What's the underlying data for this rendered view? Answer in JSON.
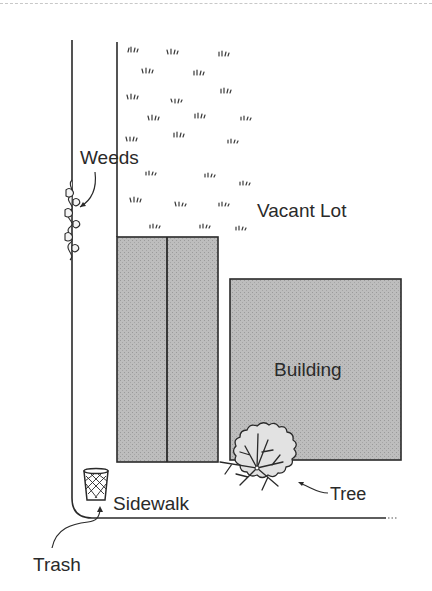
{
  "diagram": {
    "type": "site-plan-sketch",
    "labels": {
      "weeds": "Weeds",
      "vacant_lot": "Vacant Lot",
      "building": "Building",
      "tree": "Tree",
      "sidewalk": "Sidewalk",
      "trash": "Trash"
    },
    "colors": {
      "line": "#2a2a2a",
      "building_fill": "#b8b8b8",
      "tree_fill": "#e2e2e2",
      "background": "#ffffff"
    },
    "elements": [
      {
        "name": "Vacant Lot",
        "kind": "grass-area"
      },
      {
        "name": "Building",
        "kind": "large-block"
      },
      {
        "name": "Adjacent building",
        "kind": "two-part-block"
      },
      {
        "name": "Tree",
        "kind": "canopy"
      },
      {
        "name": "Weeds",
        "kind": "sidewalk-weeds"
      },
      {
        "name": "Trash",
        "kind": "waste-basket"
      },
      {
        "name": "Sidewalk",
        "kind": "path"
      }
    ]
  }
}
